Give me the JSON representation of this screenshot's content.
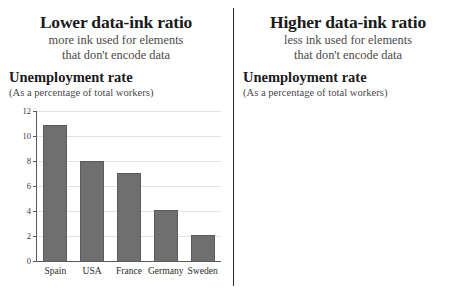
{
  "panels": [
    {
      "title": "Lower data-ink ratio",
      "subtitle_line1": "more ink used for elements",
      "subtitle_line2": "that don't encode data",
      "chart_title": "Unemployment rate",
      "chart_subtitle": "(As a percentage of total workers)"
    },
    {
      "title": "Higher data-ink ratio",
      "subtitle_line1": "less ink used for elements",
      "subtitle_line2": "that don't encode data",
      "chart_title": "Unemployment rate",
      "chart_subtitle": "(As a percentage of total workers)"
    }
  ],
  "chart_data": [
    {
      "type": "bar",
      "title": "Unemployment rate",
      "subtitle": "(As a percentage of total workers)",
      "xlabel": "",
      "ylabel": "",
      "categories": [
        "Spain",
        "USA",
        "France",
        "Germany",
        "Sweden"
      ],
      "values": [
        11.0,
        8.1,
        7.1,
        4.2,
        2.2
      ],
      "ylim": [
        0,
        12
      ],
      "yticks": [
        0,
        2,
        4,
        6,
        8,
        10,
        12
      ],
      "ytick_labels": [
        "0",
        "2",
        "4",
        "6",
        "8",
        "10",
        "12"
      ],
      "grid": true,
      "legend": "none",
      "style": "filled-bars-gridlines",
      "bar_color": "#6f6f6f",
      "grid_color": "#e2e2e2",
      "axis_color": "#5a5a5a"
    },
    {
      "type": "bar",
      "title": "Unemployment rate",
      "subtitle": "(As a percentage of total workers)",
      "xlabel": "",
      "ylabel": "",
      "categories": [
        "Spain",
        "USA",
        "France",
        "Germany",
        "Sweden"
      ],
      "values": [
        11.0,
        8.1,
        7.1,
        4.2,
        2.2
      ],
      "ylim": [
        0,
        12
      ],
      "yticks": [
        0,
        4,
        8,
        12
      ],
      "ytick_labels": [
        "0",
        "4",
        "8",
        "12"
      ],
      "grid": false,
      "legend": "none",
      "style": "minimal-outline-bars",
      "bar_color": "#9a9a9a",
      "tick_color": "#7d7d7d"
    }
  ],
  "colors": {
    "divider": "#2b2b2b",
    "text": "#1a1a1a",
    "muted_text": "#4a4a4a"
  }
}
